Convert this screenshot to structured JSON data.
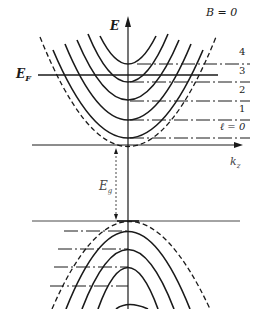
{
  "diagram": {
    "labels": {
      "energy_axis": "E",
      "fermi_level_main": "E",
      "fermi_level_sub": "F",
      "zero_field": "B = 0",
      "kz_main": "k",
      "kz_sub": "z",
      "gap_main": "E",
      "gap_sub": "g"
    },
    "conduction_levels": [
      {
        "index": "4",
        "label": "4"
      },
      {
        "index": "3",
        "label": "3"
      },
      {
        "index": "2",
        "label": "2"
      },
      {
        "index": "1",
        "label": "1"
      },
      {
        "index": "0",
        "label": "ℓ = 0"
      }
    ],
    "colors": {
      "line": "#1a1a1a",
      "axis": "#333333",
      "background": "#ffffff"
    }
  }
}
